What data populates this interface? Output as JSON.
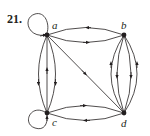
{
  "exercise_number": "21.",
  "graph": {
    "type": "directed multigraph",
    "vertices": [
      "a",
      "b",
      "c",
      "d"
    ],
    "edges": [
      {
        "from": "a",
        "to": "a",
        "kind": "loop"
      },
      {
        "from": "c",
        "to": "c",
        "kind": "loop"
      },
      {
        "from": "b",
        "to": "a"
      },
      {
        "from": "a",
        "to": "b"
      },
      {
        "from": "c",
        "to": "d"
      },
      {
        "from": "d",
        "to": "c"
      },
      {
        "from": "a",
        "to": "d"
      },
      {
        "from": "a",
        "to": "c"
      },
      {
        "from": "c",
        "to": "a"
      },
      {
        "from": "a",
        "to": "c"
      },
      {
        "from": "d",
        "to": "b"
      },
      {
        "from": "b",
        "to": "d"
      },
      {
        "from": "b",
        "to": "d"
      },
      {
        "from": "d",
        "to": "b"
      }
    ]
  },
  "colors": {
    "ink": "#231f20"
  }
}
